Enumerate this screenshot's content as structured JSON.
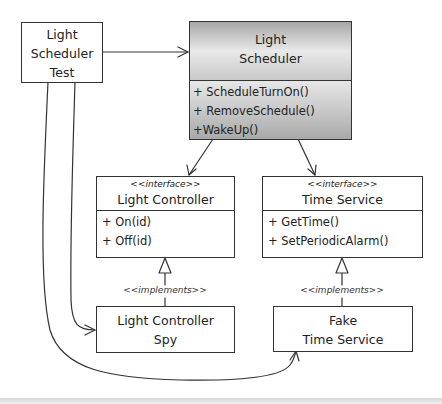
{
  "diagram": {
    "type": "uml-class-diagram",
    "nodes": {
      "test": {
        "title_lines": [
          "Light",
          "Scheduler",
          "Test"
        ]
      },
      "scheduler": {
        "title_lines": [
          "Light",
          "Scheduler"
        ],
        "operations": [
          "+ ScheduleTurnOn()",
          "+ RemoveSchedule()",
          "+WakeUp()"
        ],
        "fill": "gray-gradient"
      },
      "light_controller": {
        "stereotype": "<<interface>>",
        "title": "Light Controller",
        "operations": [
          "+ On(id)",
          "+ Off(id)"
        ]
      },
      "time_service": {
        "stereotype": "<<interface>>",
        "title": "Time Service",
        "operations": [
          "+ GetTime()",
          "+ SetPeriodicAlarm()"
        ]
      },
      "light_controller_spy": {
        "title_lines": [
          "Light Controller",
          "Spy"
        ]
      },
      "fake_time_service": {
        "title_lines": [
          "Fake",
          "Time Service"
        ]
      }
    },
    "edges": [
      {
        "from": "Light Scheduler Test",
        "to": "Light Scheduler",
        "kind": "association"
      },
      {
        "from": "Light Scheduler",
        "to": "Light Controller",
        "kind": "association"
      },
      {
        "from": "Light Scheduler",
        "to": "Time Service",
        "kind": "association"
      },
      {
        "from": "Light Controller Spy",
        "to": "Light Controller",
        "kind": "realization",
        "label": "<<implements>>"
      },
      {
        "from": "Fake Time Service",
        "to": "Time Service",
        "kind": "realization",
        "label": "<<implements>>"
      },
      {
        "from": "Light Scheduler Test",
        "to": "Light Controller Spy",
        "kind": "association"
      },
      {
        "from": "Light Scheduler Test",
        "to": "Fake Time Service",
        "kind": "association"
      }
    ],
    "labels": {
      "implements_left": "<<implements>>",
      "implements_right": "<<implements>>"
    },
    "colors": {
      "line": "#333333",
      "background": "#ffffff",
      "scheduler_fill_dark": "#9d9d9d",
      "scheduler_fill_light": "#ededed"
    }
  }
}
